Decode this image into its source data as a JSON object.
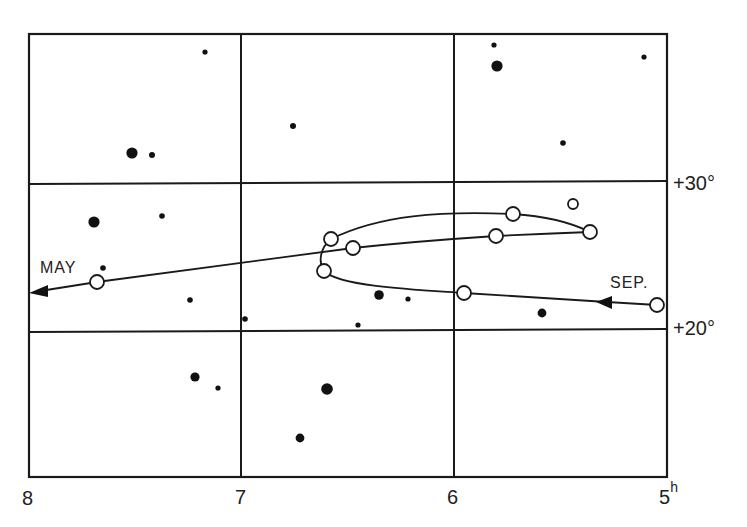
{
  "axes": {
    "x_ticks": [
      {
        "label": "8",
        "x": 29
      },
      {
        "label": "7",
        "x": 241
      },
      {
        "label": "6",
        "x": 454
      },
      {
        "label": "5",
        "sup": "h",
        "x": 667
      }
    ],
    "y_ticks": [
      {
        "label": "+30°",
        "y": 182
      },
      {
        "label": "+20°",
        "y": 331
      }
    ]
  },
  "labels": {
    "start_month": "SEP.",
    "end_month": "MAY"
  },
  "colors": {
    "ink": "#1a1a1a",
    "background": "#ffffff"
  },
  "chart_data": {
    "type": "scatter",
    "title": "",
    "xlabel": "Right Ascension (h)",
    "ylabel": "Declination (°)",
    "xlim": [
      8,
      5
    ],
    "ylim": [
      15,
      35
    ],
    "x_tick_labels": [
      "8",
      "7",
      "6",
      "5h"
    ],
    "y_tick_labels": [
      "+30°",
      "+20°"
    ],
    "grid": true,
    "series": [
      {
        "name": "planet path (open circles, Sep → May)",
        "marker": "open-circle",
        "points": [
          {
            "ra": 5.05,
            "dec": 20.9
          },
          {
            "ra": 5.95,
            "dec": 22.6
          },
          {
            "ra": 6.62,
            "dec": 24.0
          },
          {
            "ra": 6.58,
            "dec": 26.2
          },
          {
            "ra": 5.72,
            "dec": 27.5
          },
          {
            "ra": 5.36,
            "dec": 26.6
          },
          {
            "ra": 5.83,
            "dec": 26.3
          },
          {
            "ra": 6.48,
            "dec": 25.6
          },
          {
            "ra": 7.68,
            "dec": 23.3
          }
        ],
        "extra_points": [
          {
            "ra": 5.44,
            "dec": 28.6
          }
        ]
      },
      {
        "name": "stars (filled dots, size ~ brightness)",
        "marker": "filled-dot",
        "points": [
          {
            "ra": 7.18,
            "dec": 33.6,
            "size": "small"
          },
          {
            "ra": 7.52,
            "dec": 32.1,
            "size": "large"
          },
          {
            "ra": 7.43,
            "dec": 32.0,
            "size": "small"
          },
          {
            "ra": 6.77,
            "dec": 33.3,
            "size": "small"
          },
          {
            "ra": 5.8,
            "dec": 33.2,
            "size": "large"
          },
          {
            "ra": 5.81,
            "dec": 34.5,
            "size": "small"
          },
          {
            "ra": 5.11,
            "dec": 33.8,
            "size": "small"
          },
          {
            "ra": 5.49,
            "dec": 32.6,
            "size": "small"
          },
          {
            "ra": 7.7,
            "dec": 28.6,
            "size": "large"
          },
          {
            "ra": 7.37,
            "dec": 29.0,
            "size": "small"
          },
          {
            "ra": 7.66,
            "dec": 24.3,
            "size": "small"
          },
          {
            "ra": 7.24,
            "dec": 22.2,
            "size": "small"
          },
          {
            "ra": 6.98,
            "dec": 20.8,
            "size": "small"
          },
          {
            "ra": 6.35,
            "dec": 22.4,
            "size": "medium"
          },
          {
            "ra": 6.22,
            "dec": 22.1,
            "size": "small"
          },
          {
            "ra": 6.45,
            "dec": 20.4,
            "size": "small"
          },
          {
            "ra": 5.58,
            "dec": 21.2,
            "size": "medium"
          },
          {
            "ra": 7.22,
            "dec": 16.9,
            "size": "medium"
          },
          {
            "ra": 7.11,
            "dec": 16.2,
            "size": "small"
          },
          {
            "ra": 6.61,
            "dec": 16.1,
            "size": "large"
          },
          {
            "ra": 6.74,
            "dec": 12.8,
            "size": "medium"
          }
        ]
      }
    ],
    "annotations": [
      {
        "text": "SEP.",
        "near": "start of path (right)"
      },
      {
        "text": "MAY",
        "near": "end of path (left)"
      }
    ]
  },
  "figure": {
    "grid_x": [
      29,
      241,
      454,
      667
    ],
    "grid_y": [
      34,
      182,
      331,
      477
    ],
    "stars": [
      [
        205,
        52,
        2.6
      ],
      [
        132,
        153,
        5.6
      ],
      [
        152,
        155,
        3
      ],
      [
        293,
        126,
        3
      ],
      [
        497,
        66,
        5.6
      ],
      [
        494,
        45,
        2.6
      ],
      [
        644,
        57,
        2.6
      ],
      [
        563,
        143,
        2.8
      ],
      [
        94,
        222,
        5.6
      ],
      [
        162,
        216,
        2.8
      ],
      [
        103,
        268,
        2.8
      ],
      [
        190,
        300,
        2.8
      ],
      [
        245,
        319,
        2.8
      ],
      [
        379,
        295,
        4.8
      ],
      [
        408,
        299,
        2.6
      ],
      [
        358,
        325,
        2.6
      ],
      [
        542,
        313,
        4.4
      ],
      [
        195,
        377,
        4.6
      ],
      [
        218,
        388,
        2.6
      ],
      [
        327,
        389,
        5.8
      ],
      [
        300,
        438,
        4.4
      ]
    ],
    "planets": [
      [
        657,
        305,
        7
      ],
      [
        464,
        293,
        7
      ],
      [
        324,
        271,
        7
      ],
      [
        331,
        239,
        7
      ],
      [
        513,
        214,
        7
      ],
      [
        590,
        232,
        7
      ],
      [
        496,
        236,
        7
      ],
      [
        353,
        248,
        7
      ],
      [
        97,
        282,
        7
      ],
      [
        573,
        204,
        5
      ]
    ]
  }
}
